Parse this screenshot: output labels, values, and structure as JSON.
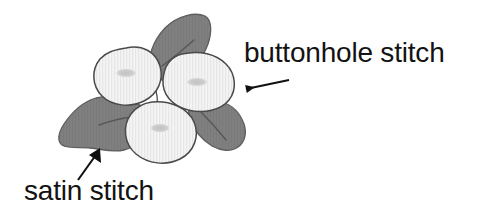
{
  "figure": {
    "background_color": "#ffffff",
    "colors": {
      "petal_fill": "#f2f2f2",
      "petal_stripe": "#e2e2e2",
      "petal_outline": "#4a4a4a",
      "petal_center": "#c9c9c9",
      "leaf_fill": "#7e7e7e",
      "leaf_outline": "#5e5e5e",
      "leaf_vein": "#5a5a5a",
      "arrow": "#101010",
      "text": "#131313"
    },
    "petals": [
      {
        "name": "left-petal",
        "stitch": "buttonhole stitch"
      },
      {
        "name": "right-petal",
        "stitch": "buttonhole stitch"
      },
      {
        "name": "bottom-petal",
        "stitch": "buttonhole stitch"
      }
    ],
    "leaves": [
      {
        "name": "top-leaf",
        "stitch": "satin stitch"
      },
      {
        "name": "left-leaf",
        "stitch": "satin stitch"
      },
      {
        "name": "right-leaf",
        "stitch": "satin stitch"
      }
    ]
  },
  "annotations": {
    "buttonhole": {
      "label": "buttonhole stitch",
      "arrow_name": "buttonhole-arrow",
      "points_to": "right-petal",
      "direction": "left"
    },
    "satin": {
      "label": "satin stitch",
      "arrow_name": "satin-arrow",
      "points_to": "left-leaf",
      "direction": "up-right"
    }
  }
}
